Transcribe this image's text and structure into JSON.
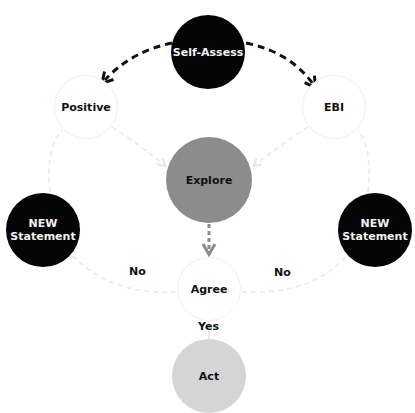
{
  "diagram": {
    "nodes": {
      "self_assess": {
        "label": "Self-Assess",
        "fill": "#050505"
      },
      "positive": {
        "label": "Positive",
        "fill": "#ffffff"
      },
      "ebi": {
        "label": "EBI",
        "fill": "#ffffff"
      },
      "explore": {
        "label": "Explore",
        "fill": "#8c8c8c"
      },
      "new_statement_left": {
        "label_line1": "NEW",
        "label_line2": "Statement",
        "fill": "#050505"
      },
      "new_statement_right": {
        "label_line1": "NEW",
        "label_line2": "Statement",
        "fill": "#050505"
      },
      "agree": {
        "label": "Agree",
        "fill": "#ffffff"
      },
      "act": {
        "label": "Act",
        "fill": "#d5d5d5"
      }
    },
    "edge_labels": {
      "no_left": "No",
      "no_right": "No",
      "yes": "Yes"
    },
    "edges": [
      {
        "from": "Self-Assess",
        "to": "Positive",
        "style": "dashed-dark"
      },
      {
        "from": "Self-Assess",
        "to": "EBI",
        "style": "dashed-dark"
      },
      {
        "from": "Positive",
        "to": "Explore",
        "style": "dashed-faint"
      },
      {
        "from": "EBI",
        "to": "Explore",
        "style": "dashed-faint"
      },
      {
        "from": "Explore",
        "to": "Agree",
        "style": "dashed-gray"
      },
      {
        "from": "Agree",
        "to": "NEW Statement (left)",
        "label": "No",
        "style": "dashed-faint"
      },
      {
        "from": "Agree",
        "to": "NEW Statement (right)",
        "label": "No",
        "style": "dashed-faint"
      },
      {
        "from": "NEW Statement (left)",
        "to": "Positive",
        "style": "dashed-faint"
      },
      {
        "from": "NEW Statement (right)",
        "to": "EBI",
        "style": "dashed-faint"
      },
      {
        "from": "Agree",
        "to": "Act",
        "label": "Yes",
        "style": "solid-faint"
      }
    ]
  }
}
